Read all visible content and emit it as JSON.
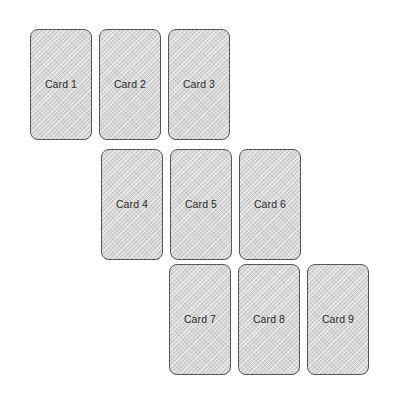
{
  "board": {
    "name": "card-staircase-board",
    "background_color": "#ffffff",
    "card_fill_color": "#d5d5d5",
    "card_border_color": "#575757",
    "card_label_color": "#2b2b2b",
    "rows": [
      {
        "row_label": "row-1",
        "cards": [
          {
            "label": "Card 1"
          },
          {
            "label": "Card 2"
          },
          {
            "label": "Card 3"
          }
        ]
      },
      {
        "row_label": "row-2",
        "cards": [
          {
            "label": "Card 4"
          },
          {
            "label": "Card 5"
          },
          {
            "label": "Card 6"
          }
        ]
      },
      {
        "row_label": "row-3",
        "cards": [
          {
            "label": "Card 7"
          },
          {
            "label": "Card 8"
          },
          {
            "label": "Card 9"
          }
        ]
      }
    ]
  }
}
